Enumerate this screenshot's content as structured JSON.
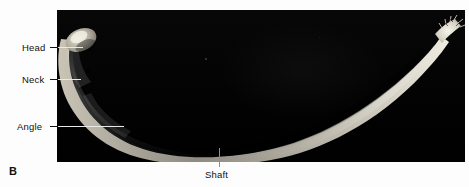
{
  "figure": {
    "panel_letter": "B",
    "background_color": "#ffffff",
    "photo_background_color": "#050505",
    "bone_color": "#d8d4c8",
    "leader_line_color": "#e8e8e8"
  },
  "labels": {
    "head": "Head",
    "neck": "Neck",
    "angle": "Angle",
    "shaft": "Shaft"
  }
}
